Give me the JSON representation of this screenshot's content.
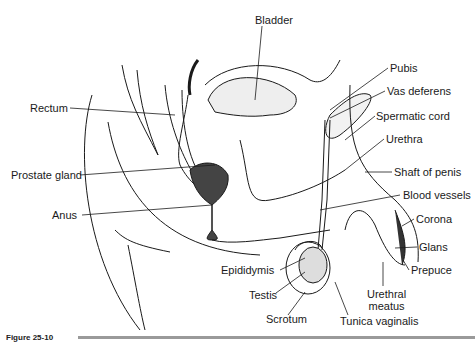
{
  "figure": {
    "caption": "Figure 25-10",
    "labels": [
      {
        "id": "bladder",
        "text": "Bladder",
        "x": 255,
        "y": 14
      },
      {
        "id": "pubis",
        "text": "Pubis",
        "x": 390,
        "y": 62
      },
      {
        "id": "vas-deferens",
        "text": "Vas deferens",
        "x": 387,
        "y": 85
      },
      {
        "id": "spermatic-cord",
        "text": "Spermatic cord",
        "x": 376,
        "y": 110
      },
      {
        "id": "urethra",
        "text": "Urethra",
        "x": 386,
        "y": 133
      },
      {
        "id": "shaft-of-penis",
        "text": "Shaft of penis",
        "x": 394,
        "y": 166
      },
      {
        "id": "blood-vessels",
        "text": "Blood vessels",
        "x": 403,
        "y": 189
      },
      {
        "id": "corona",
        "text": "Corona",
        "x": 416,
        "y": 213
      },
      {
        "id": "glans",
        "text": "Glans",
        "x": 419,
        "y": 241
      },
      {
        "id": "prepuce",
        "text": "Prepuce",
        "x": 411,
        "y": 264
      },
      {
        "id": "urethral-meatus",
        "text": "Urethral\nmeatus",
        "x": 367,
        "y": 288
      },
      {
        "id": "tunica-vaginalis",
        "text": "Tunica vaginalis",
        "x": 340,
        "y": 315
      },
      {
        "id": "scrotum",
        "text": "Scrotum",
        "x": 266,
        "y": 313
      },
      {
        "id": "testis",
        "text": "Testis",
        "x": 249,
        "y": 289
      },
      {
        "id": "epididymis",
        "text": "Epididymis",
        "x": 221,
        "y": 264
      },
      {
        "id": "anus",
        "text": "Anus",
        "x": 52,
        "y": 209
      },
      {
        "id": "prostate-gland",
        "text": "Prostate gland",
        "x": 11,
        "y": 169
      },
      {
        "id": "rectum",
        "text": "Rectum",
        "x": 30,
        "y": 102
      }
    ]
  }
}
